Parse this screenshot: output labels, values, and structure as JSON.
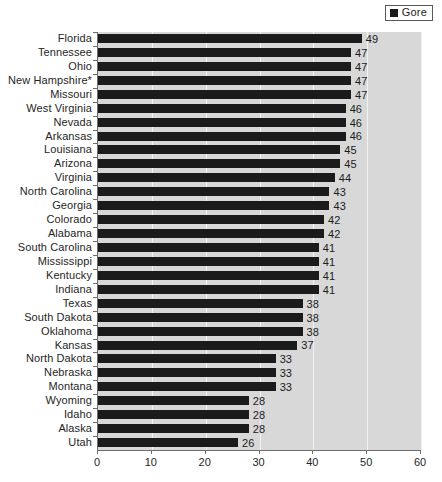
{
  "legend": {
    "label": "Gore",
    "swatch_color": "#1b1b1b"
  },
  "axis": {
    "ticks": [
      "0",
      "10",
      "20",
      "30",
      "40",
      "50",
      "60"
    ]
  },
  "colors": {
    "bar": "#1b1b1b",
    "plot_background": "#d8d8d8",
    "gridline": "#f2f2f2",
    "axis_line": "#6e6e6e",
    "text": "#262626"
  },
  "chart_data": {
    "type": "bar",
    "orientation": "horizontal",
    "title": "",
    "subtitle": "",
    "xlabel": "",
    "ylabel": "",
    "xlim": [
      0,
      60
    ],
    "xticks": [
      0,
      10,
      20,
      30,
      40,
      50,
      60
    ],
    "grid": "vertical",
    "legend_position": "top-right",
    "series": [
      {
        "name": "Gore",
        "color": "#1b1b1b",
        "values": [
          49,
          47,
          47,
          47,
          47,
          46,
          46,
          46,
          45,
          45,
          44,
          43,
          43,
          42,
          42,
          41,
          41,
          41,
          41,
          38,
          38,
          38,
          37,
          33,
          33,
          33,
          28,
          28,
          28,
          26
        ]
      }
    ],
    "categories": [
      "Florida",
      "Tennessee",
      "Ohio",
      "New Hampshire*",
      "Missouri",
      "West Virginia",
      "Nevada",
      "Arkansas",
      "Louisiana",
      "Arizona",
      "Virginia",
      "North Carolina",
      "Georgia",
      "Colorado",
      "Alabama",
      "South Carolina",
      "Mississippi",
      "Kentucky",
      "Indiana",
      "Texas",
      "South Dakota",
      "Oklahoma",
      "Kansas",
      "North Dakota",
      "Nebraska",
      "Montana",
      "Wyoming",
      "Idaho",
      "Alaska",
      "Utah"
    ],
    "data_labels": [
      "49",
      "47",
      "47",
      "47",
      "47",
      "46",
      "46",
      "46",
      "45",
      "45",
      "44",
      "43",
      "43",
      "42",
      "42",
      "41",
      "41",
      "41",
      "41",
      "38",
      "38",
      "38",
      "37",
      "33",
      "33",
      "33",
      "28",
      "28",
      "28",
      "26"
    ]
  }
}
